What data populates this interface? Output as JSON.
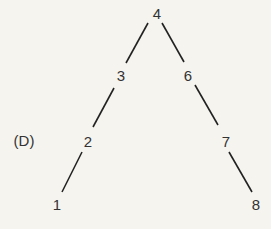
{
  "diagram": {
    "label": "(D)",
    "label_pos": [
      24,
      140
    ],
    "line_color": "#222222",
    "nodes": [
      {
        "id": "4",
        "x": 157,
        "y": 13
      },
      {
        "id": "3",
        "x": 121,
        "y": 75
      },
      {
        "id": "6",
        "x": 188,
        "y": 75
      },
      {
        "id": "2",
        "x": 88,
        "y": 141
      },
      {
        "id": "7",
        "x": 226,
        "y": 141
      },
      {
        "id": "1",
        "x": 57,
        "y": 204
      },
      {
        "id": "8",
        "x": 256,
        "y": 204
      }
    ],
    "edges": [
      {
        "from": "4",
        "to": "3",
        "x1": 148,
        "y1": 23,
        "x2": 126,
        "y2": 63
      },
      {
        "from": "4",
        "to": "6",
        "x1": 162,
        "y1": 23,
        "x2": 184,
        "y2": 62
      },
      {
        "from": "3",
        "to": "2",
        "x1": 114,
        "y1": 88,
        "x2": 93,
        "y2": 127
      },
      {
        "from": "6",
        "to": "7",
        "x1": 195,
        "y1": 85,
        "x2": 218,
        "y2": 125
      },
      {
        "from": "2",
        "to": "1",
        "x1": 82,
        "y1": 152,
        "x2": 62,
        "y2": 192
      },
      {
        "from": "7",
        "to": "8",
        "x1": 229,
        "y1": 152,
        "x2": 252,
        "y2": 192
      }
    ]
  }
}
